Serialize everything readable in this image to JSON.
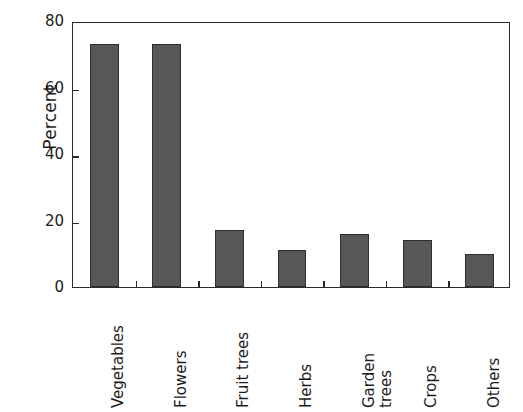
{
  "chart_data": {
    "type": "bar",
    "title": "",
    "subtitle": "",
    "xlabel": "",
    "ylabel": "Percent",
    "categories": [
      "Vegetables",
      "Flowers",
      "Fruit trees",
      "Herbs",
      "Garden trees",
      "Crops",
      "Others"
    ],
    "values": [
      73,
      73,
      17,
      11,
      16,
      14,
      10
    ],
    "ylim": [
      0,
      80
    ],
    "yticks": [
      0,
      20,
      40,
      60,
      80
    ],
    "ytick_labels": [
      "0",
      "20",
      "40",
      "60",
      "80"
    ],
    "grid": false,
    "legend": null,
    "legend_position": "none",
    "bar_color": "#575757",
    "bar_edge_color": "#2e2e2e",
    "axis_color": "#2a2a2a",
    "background_color": "#ffffff",
    "label_rotation_degrees": 90,
    "annotations": []
  }
}
